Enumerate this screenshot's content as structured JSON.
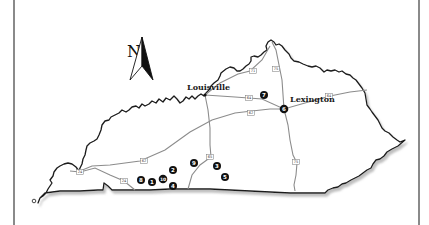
{
  "map": {
    "north_arrow": {
      "label": "N",
      "icon": "north-arrow-icon"
    },
    "cities": [
      {
        "name": "Louisville",
        "x": 205,
        "y": 95,
        "label_x": 187,
        "label_y": 90
      },
      {
        "name": "Lexington",
        "x": 284,
        "y": 109,
        "label_x": 290,
        "label_y": 102
      }
    ],
    "highways": [
      {
        "label": "71",
        "x": 253,
        "y": 71
      },
      {
        "label": "75",
        "x": 276,
        "y": 69
      },
      {
        "label": "64",
        "x": 249,
        "y": 98
      },
      {
        "label": "64",
        "x": 329,
        "y": 96
      },
      {
        "label": "62",
        "x": 251,
        "y": 113
      },
      {
        "label": "65",
        "x": 210,
        "y": 157
      },
      {
        "label": "75",
        "x": 296,
        "y": 162
      },
      {
        "label": "62",
        "x": 144,
        "y": 161
      },
      {
        "label": "24",
        "x": 80,
        "y": 172
      },
      {
        "label": "24",
        "x": 124,
        "y": 181
      }
    ],
    "markers": [
      {
        "label": "1",
        "x": 152,
        "y": 182
      },
      {
        "label": "2",
        "x": 173,
        "y": 170
      },
      {
        "label": "3",
        "x": 217,
        "y": 166
      },
      {
        "label": "4",
        "x": 173,
        "y": 186
      },
      {
        "label": "5",
        "x": 225,
        "y": 177
      },
      {
        "label": "6",
        "x": 284,
        "y": 109
      },
      {
        "label": "7",
        "x": 264,
        "y": 95
      },
      {
        "label": "8",
        "x": 141,
        "y": 180
      },
      {
        "label": "9",
        "x": 194,
        "y": 163
      },
      {
        "label": "10",
        "x": 163,
        "y": 179
      }
    ],
    "colors": {
      "border": "#1a1a1a",
      "shadow": "#9a9a9a",
      "road": "#8c8c8c",
      "marker": "#111111",
      "frame": "#8a8a8a"
    }
  }
}
